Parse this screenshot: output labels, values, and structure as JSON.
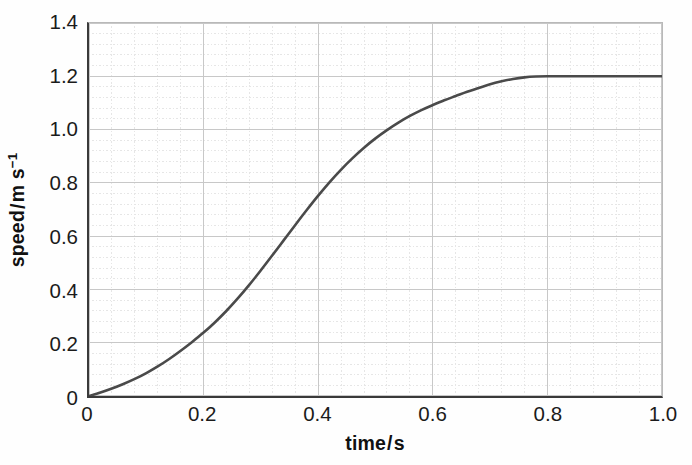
{
  "chart_data": {
    "type": "line",
    "title": "",
    "subtitle": "",
    "xlabel": "time / s",
    "xlabel_quantity": "time",
    "xlabel_unit": "s",
    "ylabel": "speed / m s⁻¹",
    "ylabel_quantity": "speed",
    "ylabel_unit_base": "m s",
    "ylabel_unit_exp": "−1",
    "xlim": [
      0,
      1.0
    ],
    "ylim": [
      0,
      1.4
    ],
    "xticks": [
      0,
      0.2,
      0.4,
      0.6,
      0.8,
      1.0
    ],
    "xticklabels": [
      "0",
      "0.2",
      "0.4",
      "0.6",
      "0.8",
      "1.0"
    ],
    "yticks": [
      0,
      0.2,
      0.4,
      0.6,
      0.8,
      1.0,
      1.2,
      1.4
    ],
    "yticklabels": [
      "0",
      "0.2",
      "0.4",
      "0.6",
      "0.8",
      "1.0",
      "1.2",
      "1.4"
    ],
    "grid": true,
    "grid_major_step_x": 0.2,
    "grid_major_step_y": 0.2,
    "grid_minor_divisions": 5,
    "grid_major_color": "#c8c8c8",
    "grid_minor_color": "#e6e6e6",
    "legend": false,
    "legend_position": "none",
    "axis_color": "#3a3a3a",
    "line_color": "#4a4a4a",
    "line_width": 2.6,
    "series": [
      {
        "name": "speed",
        "x": [
          0.0,
          0.02,
          0.04,
          0.06,
          0.08,
          0.1,
          0.12,
          0.14,
          0.16,
          0.18,
          0.2,
          0.22,
          0.24,
          0.26,
          0.28,
          0.3,
          0.32,
          0.34,
          0.36,
          0.38,
          0.4,
          0.42,
          0.44,
          0.46,
          0.48,
          0.5,
          0.52,
          0.54,
          0.56,
          0.58,
          0.6,
          0.62,
          0.64,
          0.66,
          0.68,
          0.7,
          0.72,
          0.74,
          0.76,
          0.78,
          0.8,
          0.85,
          0.9,
          0.95,
          1.0
        ],
        "y": [
          0.0,
          0.013,
          0.028,
          0.045,
          0.064,
          0.086,
          0.111,
          0.139,
          0.17,
          0.203,
          0.238,
          0.277,
          0.32,
          0.367,
          0.418,
          0.472,
          0.528,
          0.585,
          0.642,
          0.698,
          0.752,
          0.803,
          0.85,
          0.893,
          0.932,
          0.967,
          0.998,
          1.026,
          1.051,
          1.073,
          1.092,
          1.11,
          1.126,
          1.142,
          1.156,
          1.17,
          1.181,
          1.19,
          1.196,
          1.199,
          1.2,
          1.2,
          1.2,
          1.2,
          1.2
        ]
      }
    ],
    "annotations": [
      {
        "text": "plateau",
        "value": 1.2,
        "from_x": 0.73,
        "to_x": 1.0
      }
    ]
  }
}
